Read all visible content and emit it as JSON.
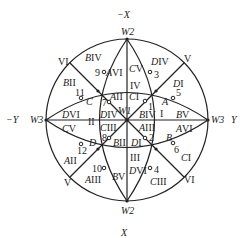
{
  "diagram": {
    "type": "stereographic-projection",
    "axes": {
      "top": "−X",
      "bottom": "X",
      "left": "−Y",
      "right": "Y"
    },
    "poles": {
      "top": "W2",
      "bottom": "W2",
      "left": "W3",
      "right": "W3",
      "center": "W1"
    },
    "outer_roman": [
      {
        "id": "vi_ul",
        "text": "VI"
      },
      {
        "id": "v_ur",
        "text": "V"
      },
      {
        "id": "v_ll",
        "text": "V"
      },
      {
        "id": "vi_lr",
        "text": "VI"
      }
    ],
    "numbered_points": [
      "1",
      "2",
      "3",
      "4",
      "5",
      "6",
      "7",
      "8",
      "9",
      "10",
      "11",
      "12"
    ],
    "region_labels": [
      {
        "id": "biv_top",
        "letter": "B",
        "roman": "IV"
      },
      {
        "id": "avi_top",
        "letter": "A",
        "roman": "VI"
      },
      {
        "id": "cv_top",
        "letter": "C",
        "roman": "V"
      },
      {
        "id": "div_top",
        "letter": "D",
        "roman": "IV"
      },
      {
        "id": "bii_ul",
        "letter": "B",
        "roman": "II"
      },
      {
        "id": "di_ur",
        "letter": "D",
        "roman": "I"
      },
      {
        "id": "c_ul",
        "letter": "C",
        "roman": ""
      },
      {
        "id": "a_ur",
        "letter": "A",
        "roman": ""
      },
      {
        "id": "aii_c",
        "letter": "A",
        "roman": "II"
      },
      {
        "id": "ci_c",
        "letter": "C",
        "roman": "I"
      },
      {
        "id": "div_c",
        "letter": "D",
        "roman": "IV"
      },
      {
        "id": "biv_c",
        "letter": "B",
        "roman": "IV"
      },
      {
        "id": "dvi_l",
        "letter": "D",
        "roman": "VI"
      },
      {
        "id": "bv_r",
        "letter": "B",
        "roman": "V"
      },
      {
        "id": "cv_l",
        "letter": "C",
        "roman": "V"
      },
      {
        "id": "avi_r",
        "letter": "A",
        "roman": "VI"
      },
      {
        "id": "ciii_c",
        "letter": "C",
        "roman": "III"
      },
      {
        "id": "aiii_c",
        "letter": "A",
        "roman": "III"
      },
      {
        "id": "bii_c",
        "letter": "B",
        "roman": "II"
      },
      {
        "id": "di_c",
        "letter": "D",
        "roman": "I"
      },
      {
        "id": "d_ll",
        "letter": "D",
        "roman": ""
      },
      {
        "id": "b_lr",
        "letter": "B",
        "roman": ""
      },
      {
        "id": "aii_ll",
        "letter": "A",
        "roman": "II"
      },
      {
        "id": "ci_lr",
        "letter": "C",
        "roman": "I"
      },
      {
        "id": "aiii_b",
        "letter": "A",
        "roman": "III"
      },
      {
        "id": "bv_b",
        "letter": "B",
        "roman": "V"
      },
      {
        "id": "dvi_b",
        "letter": "D",
        "roman": "VI"
      },
      {
        "id": "ciii_b",
        "letter": "C",
        "roman": "III"
      }
    ],
    "sector_roman": {
      "top": "IV",
      "left": "II",
      "right": "I",
      "bottom": "III"
    }
  }
}
